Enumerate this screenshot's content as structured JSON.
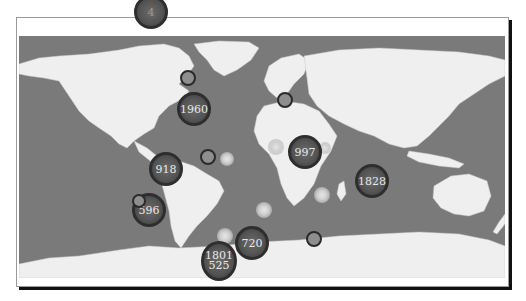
{
  "map": {
    "type": "world-cluster-map",
    "colors": {
      "ocean": "#7a7a7a",
      "land": "#efefef",
      "cluster_fill": "#555555",
      "cluster_border": "#2e2e2e",
      "small_marker": "#8e8e8e",
      "glow_marker": "#e0e0e0"
    },
    "clusters": [
      {
        "id": "arctic-canada",
        "label": "4",
        "x": 151,
        "y": 12,
        "size": 34
      },
      {
        "id": "north-atlantic",
        "label": "1960",
        "x": 194,
        "y": 109,
        "size": 34
      },
      {
        "id": "east-pacific",
        "label": "918",
        "x": 166,
        "y": 169,
        "size": 34
      },
      {
        "id": "south-pacific",
        "label": "596",
        "x": 149,
        "y": 210,
        "size": 34
      },
      {
        "id": "africa",
        "label": "997",
        "x": 305,
        "y": 152,
        "size": 34
      },
      {
        "id": "indian-ocean",
        "label": "1828",
        "x": 372,
        "y": 181,
        "size": 34
      },
      {
        "id": "south-atlantic",
        "label": "720",
        "x": 252,
        "y": 243,
        "size": 34
      },
      {
        "id": "southern-ocean-a",
        "label": "1801",
        "x": 219,
        "y": 255,
        "size": 36
      },
      {
        "id": "southern-ocean-b",
        "label": "525",
        "x": 219,
        "y": 266,
        "size": 0
      }
    ],
    "small_markers": [
      {
        "id": "newfoundland",
        "x": 188,
        "y": 78,
        "size": 16
      },
      {
        "id": "mediterranean",
        "x": 285,
        "y": 100,
        "size": 16
      },
      {
        "id": "brazil",
        "x": 208,
        "y": 157,
        "size": 16
      },
      {
        "id": "chile",
        "x": 139,
        "y": 201,
        "size": 14
      },
      {
        "id": "south-indian",
        "x": 314,
        "y": 239,
        "size": 16
      }
    ],
    "glow_markers": [
      {
        "id": "atlantic-eq",
        "x": 227,
        "y": 159,
        "size": 14
      },
      {
        "id": "gulf-guinea",
        "x": 276,
        "y": 147,
        "size": 16
      },
      {
        "id": "south-atlantic-mid",
        "x": 264,
        "y": 210,
        "size": 16
      },
      {
        "id": "madagascar-e",
        "x": 322,
        "y": 195,
        "size": 16
      },
      {
        "id": "south-atlantic-low",
        "x": 225,
        "y": 236,
        "size": 16
      },
      {
        "id": "east-africa",
        "x": 325,
        "y": 148,
        "size": 12
      }
    ]
  }
}
